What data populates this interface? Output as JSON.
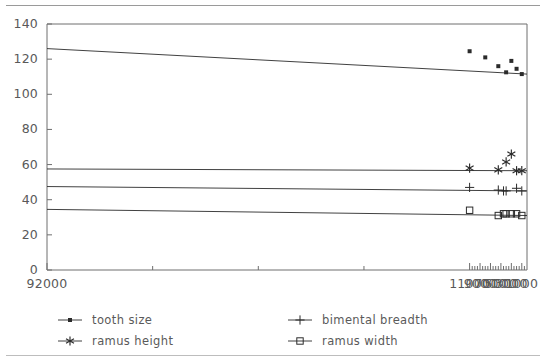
{
  "chart_data": {
    "type": "line",
    "title": "",
    "xlabel": "",
    "ylabel": "",
    "xlim": [
      92000,
      0
    ],
    "ylim": [
      0,
      140
    ],
    "x_axis_reversed": true,
    "grid": false,
    "legend_position": "below-plot",
    "x_ticks": [
      "92000",
      "11000",
      "9000",
      "7000",
      "5000",
      "3000",
      "1000"
    ],
    "x_tick_values": [
      92000,
      11000,
      9000,
      7000,
      5000,
      3000,
      1000
    ],
    "x_minor_ticks_between": 3,
    "y_ticks": [
      "0",
      "20",
      "40",
      "60",
      "80",
      "100",
      "120",
      "140"
    ],
    "y_tick_values": [
      0,
      20,
      40,
      60,
      80,
      100,
      120,
      140
    ],
    "series": [
      {
        "name": "tooth size",
        "marker": "filled-square",
        "color": "#2b2b2b",
        "x": [
          11000,
          8000,
          5500,
          4000,
          3000,
          2000,
          1000
        ],
        "values": [
          124.5,
          121.0,
          116.0,
          112.5,
          119.0,
          114.5,
          111.5
        ],
        "trend_start": 126.0,
        "trend_end": 111.5
      },
      {
        "name": "ramus height",
        "marker": "asterisk",
        "color": "#2b2b2b",
        "x": [
          11000,
          5500,
          4000,
          3000,
          2000,
          1000
        ],
        "values": [
          58.0,
          57.0,
          61.5,
          66.0,
          56.5,
          56.5
        ],
        "trend_start": 57.5,
        "trend_end": 56.5
      },
      {
        "name": "bimental breadth",
        "marker": "plus",
        "color": "#2b2b2b",
        "x": [
          11000,
          5500,
          4500,
          4000,
          2000,
          1000
        ],
        "values": [
          47.0,
          45.5,
          45.0,
          45.0,
          46.5,
          45.0
        ],
        "trend_start": 47.5,
        "trend_end": 45.0
      },
      {
        "name": "ramus width",
        "marker": "open-square",
        "color": "#2b2b2b",
        "x": [
          11000,
          5500,
          4500,
          4000,
          3000,
          2000,
          1000
        ],
        "values": [
          34.0,
          31.0,
          32.0,
          32.0,
          32.0,
          32.0,
          31.0
        ],
        "trend_start": 34.5,
        "trend_end": 31.0
      }
    ]
  },
  "legend": {
    "items": [
      {
        "label": "tooth size",
        "marker": "filled-square"
      },
      {
        "label": "bimental breadth",
        "marker": "plus"
      },
      {
        "label": "ramus height",
        "marker": "asterisk"
      },
      {
        "label": "ramus width",
        "marker": "open-square"
      }
    ]
  },
  "colors": {
    "ink": "#2b2b2b",
    "axis": "#6e6e6e",
    "text": "#595959",
    "rule": "#9a9a9a"
  }
}
